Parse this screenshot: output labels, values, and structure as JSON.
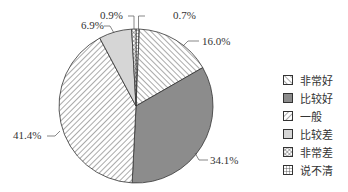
{
  "chart_data": {
    "type": "pie",
    "title": "",
    "start_angle_deg": 0,
    "direction": "clockwise",
    "slices": [
      {
        "label": "说不清",
        "value": 0.7,
        "pattern": "grid",
        "color": "#ffffff"
      },
      {
        "label": "非常好",
        "value": 16.0,
        "pattern": "back-diagonal",
        "color": "#ffffff"
      },
      {
        "label": "比较好",
        "value": 34.1,
        "pattern": "solid",
        "color": "#8c8c8c"
      },
      {
        "label": "一般",
        "value": 41.4,
        "pattern": "forward-diagonal",
        "color": "#ffffff"
      },
      {
        "label": "比较差",
        "value": 6.9,
        "pattern": "solid",
        "color": "#d6d6d6"
      },
      {
        "label": "非常差",
        "value": 0.9,
        "pattern": "crosshatch",
        "color": "#ffffff"
      }
    ],
    "data_labels": [
      "0.7%",
      "16.0%",
      "34.1%",
      "41.4%",
      "6.9%",
      "0.9%"
    ],
    "legend": {
      "position": "right",
      "entries": [
        "非常好",
        "比较好",
        "一般",
        "比较差",
        "非常差",
        "说不清"
      ]
    }
  }
}
